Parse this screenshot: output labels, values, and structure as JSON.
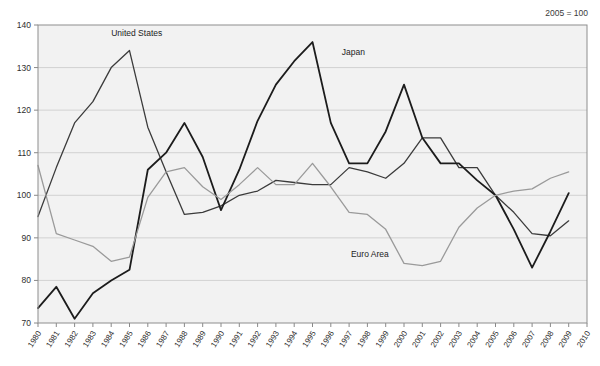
{
  "annotation": {
    "base_note": "2005 = 100"
  },
  "chart_data": {
    "type": "line",
    "title": "",
    "subtitle": "",
    "xlabel": "",
    "ylabel": "",
    "note": "2005 = 100",
    "grid": true,
    "legend_position": "inline-labels",
    "xlim": [
      1980,
      2010
    ],
    "ylim": [
      70,
      140
    ],
    "yticks": [
      70,
      80,
      90,
      100,
      110,
      120,
      130,
      140
    ],
    "x": [
      1980,
      1981,
      1982,
      1983,
      1984,
      1985,
      1986,
      1987,
      1988,
      1989,
      1990,
      1991,
      1992,
      1993,
      1994,
      1995,
      1996,
      1997,
      1998,
      1999,
      2000,
      2001,
      2002,
      2003,
      2004,
      2005,
      2006,
      2007,
      2008,
      2009,
      2010
    ],
    "xticklabels": [
      "1980",
      "1981",
      "1982",
      "1983",
      "1984",
      "1985",
      "1986",
      "1987",
      "1988",
      "1989",
      "1990",
      "1991",
      "1992",
      "1993",
      "1994",
      "1995",
      "1996",
      "1997",
      "1998",
      "1999",
      "2000",
      "2001",
      "2002",
      "2003",
      "2004",
      "2005",
      "2006",
      "2007",
      "2008",
      "2009",
      "2010"
    ],
    "series": [
      {
        "name": "United States",
        "label": "United States",
        "color": "#3b3b3b",
        "width": 1.3,
        "label_x": 1984,
        "label_y": 137.5,
        "values": [
          95.0,
          106.5,
          117.0,
          122.0,
          130.0,
          134.0,
          116.0,
          105.5,
          95.5,
          96.0,
          97.5,
          100.0,
          101.0,
          103.5,
          103.0,
          102.5,
          102.5,
          106.5,
          105.5,
          104.0,
          107.5,
          113.5,
          113.5,
          106.5,
          106.5,
          100.0,
          96.0,
          91.0,
          90.5,
          94.0,
          null
        ]
      },
      {
        "name": "Japan",
        "label": "Japan",
        "color": "#1c1c1c",
        "width": 1.8,
        "label_x": 1996.6,
        "label_y": 133.0,
        "values": [
          73.5,
          78.5,
          71.0,
          77.0,
          80.0,
          82.5,
          106.0,
          110.0,
          117.0,
          109.0,
          96.5,
          106.0,
          117.5,
          126.0,
          131.5,
          136.0,
          117.0,
          107.5,
          107.5,
          115.0,
          126.0,
          113.5,
          107.5,
          107.5,
          103.5,
          100.0,
          92.0,
          83.0,
          91.5,
          100.5,
          null
        ]
      },
      {
        "name": "Euro Area",
        "label": "Euro Area",
        "color": "#9a9a9a",
        "width": 1.3,
        "label_x": 1997.1,
        "label_y": 85.5,
        "values": [
          107.0,
          91.0,
          89.5,
          88.0,
          84.5,
          85.5,
          99.5,
          105.5,
          106.5,
          102.0,
          99.0,
          102.5,
          106.5,
          102.5,
          102.5,
          107.5,
          102.0,
          96.0,
          95.5,
          92.0,
          84.0,
          83.5,
          84.5,
          92.5,
          97.0,
          100.0,
          101.0,
          101.5,
          104.0,
          105.5,
          null
        ]
      }
    ]
  }
}
